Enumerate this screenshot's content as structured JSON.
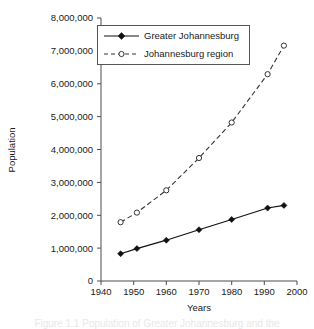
{
  "chart_data": {
    "type": "line",
    "title": "",
    "xlabel": "Years",
    "ylabel": "Population",
    "xlim": [
      1940,
      2000
    ],
    "ylim": [
      0,
      8000000
    ],
    "xticks": [
      "1940",
      "1950",
      "1960",
      "1970",
      "1980",
      "1990",
      "2000"
    ],
    "xtick_values": [
      1940,
      1950,
      1960,
      1970,
      1980,
      1990,
      2000
    ],
    "yticks": [
      "0",
      "1,000,000",
      "2,000,000",
      "3,000,000",
      "4,000,000",
      "5,000,000",
      "6,000,000",
      "7,000,000",
      "8,000,000"
    ],
    "ytick_values": [
      0,
      1000000,
      2000000,
      3000000,
      4000000,
      5000000,
      6000000,
      7000000,
      8000000
    ],
    "grid": false,
    "legend_position": "top-center",
    "series": [
      {
        "name": "Greater Johannesburg",
        "line_style": "solid",
        "marker": "filled-diamond",
        "color": "#111111",
        "x": [
          1946,
          1951,
          1960,
          1970,
          1980,
          1991,
          1996
        ],
        "values": [
          830000,
          985000,
          1240000,
          1560000,
          1870000,
          2220000,
          2300000
        ]
      },
      {
        "name": "Johannesburg region",
        "line_style": "dashed",
        "marker": "open-circle",
        "color": "#333333",
        "x": [
          1946,
          1951,
          1960,
          1970,
          1980,
          1991,
          1996
        ],
        "values": [
          1790000,
          2080000,
          2760000,
          3740000,
          4820000,
          6290000,
          7160000
        ]
      }
    ]
  },
  "legend": {
    "items": [
      {
        "label": "Greater Johannesburg"
      },
      {
        "label": "Johannesburg region"
      }
    ]
  },
  "axes": {
    "x_title": "Years",
    "y_title": "Population"
  },
  "caption": {
    "text": "Figure 1.1   Population of Greater Johannesburg and the"
  }
}
